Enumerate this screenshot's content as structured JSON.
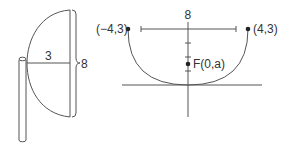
{
  "colors": {
    "stroke": "#555555",
    "text": "#333333",
    "background": "#ffffff"
  },
  "left_figure": {
    "radius_label": "3",
    "height_label": "8"
  },
  "right_figure": {
    "width_label": "8",
    "left_point_label": "(−4,3)",
    "right_point_label": "(4,3)",
    "focus_label": "F(0,a)"
  }
}
